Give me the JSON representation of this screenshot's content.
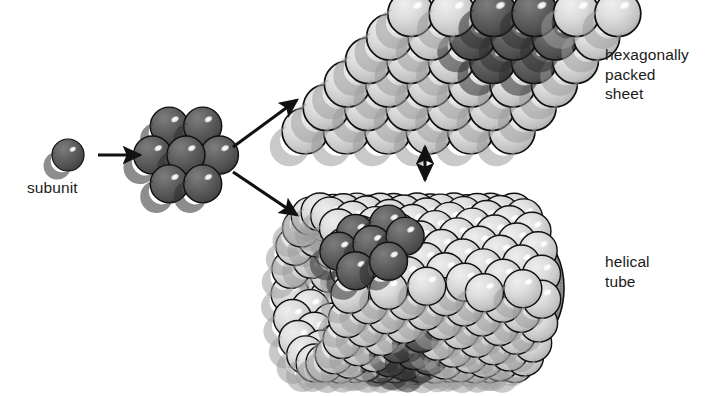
{
  "diagram": {
    "background_color": "#ffffff",
    "labels": {
      "subunit": "subunit",
      "sheet": "hexagonally\npacked\nsheet",
      "sheet_lines": [
        "hexagonally",
        "packed",
        "sheet"
      ],
      "tube": "helical\ntube",
      "tube_lines": [
        "helical",
        "tube"
      ]
    },
    "colors": {
      "subunit_dark": "#575757",
      "subunit_dark_shade": "#3f3f3f",
      "subunit_light": "#d6d6d6",
      "subunit_light_shade": "#a8a8a8",
      "tube_interior": "#8a8a8a",
      "outline": "#101010",
      "highlight": "#ffffff",
      "text": "#1a1a1a"
    },
    "arrows": [
      {
        "name": "subunit-to-cluster",
        "kind": "single",
        "direction": "right",
        "x1": 98,
        "y1": 155,
        "x2": 140,
        "y2": 155
      },
      {
        "name": "cluster-to-sheet",
        "kind": "single",
        "direction": "up-right",
        "x1": 233,
        "y1": 147,
        "x2": 297,
        "y2": 100
      },
      {
        "name": "cluster-to-tube",
        "kind": "single",
        "direction": "down-right",
        "x1": 233,
        "y1": 172,
        "x2": 297,
        "y2": 215
      },
      {
        "name": "sheet-tube-equilibrium",
        "kind": "double",
        "direction": "vertical",
        "x1": 425,
        "y1": 147,
        "x2": 425,
        "y2": 180
      }
    ],
    "structures": {
      "subunit": {
        "name": "single subunit sphere",
        "shade": "dark",
        "count": 1,
        "center": [
          68,
          155
        ],
        "radius": 16
      },
      "cluster": {
        "name": "seven subunit hexagonal cluster",
        "shade": "dark",
        "count": 7,
        "rows": [
          2,
          3,
          2
        ],
        "center": [
          186,
          155
        ],
        "radius": 19
      },
      "sheet": {
        "name": "hexagonally packed sheet",
        "lattice": "rhomboid",
        "columns": 6,
        "rows": 6,
        "total_subunits": 36,
        "dark_subunits": 7,
        "dark_rows": [
          2,
          3,
          2
        ],
        "radius": 23
      },
      "tube": {
        "name": "helical tube",
        "orientation": "horizontal cylinder",
        "dark_subunits": 7,
        "open_end": "right",
        "radius": 19
      }
    }
  }
}
